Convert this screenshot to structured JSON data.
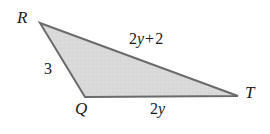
{
  "figure": {
    "type": "triangle-geometry-diagram",
    "background_color": "#ffffff",
    "fill_color": "#d7d7d7",
    "stroke_color": "#6b6b6b",
    "stroke_width": 2,
    "text_color": "#1a1a1a",
    "vertices": [
      {
        "name": "R",
        "label": "R",
        "x": 40,
        "y": 23
      },
      {
        "name": "Q",
        "label": "Q",
        "x": 85,
        "y": 97
      },
      {
        "name": "T",
        "label": "T",
        "x": 238,
        "y": 96
      }
    ],
    "sides": [
      {
        "name": "RQ",
        "from": "R",
        "to": "Q",
        "label": "3",
        "label_parts": {
          "coefficient": "3",
          "variable": "",
          "operator": "",
          "constant": ""
        }
      },
      {
        "name": "RT",
        "from": "R",
        "to": "T",
        "label": "2y + 2",
        "label_parts": {
          "coefficient": "2",
          "variable": "y",
          "operator": "+",
          "constant": "2"
        }
      },
      {
        "name": "QT",
        "from": "Q",
        "to": "T",
        "label": "2y",
        "label_parts": {
          "coefficient": "2",
          "variable": "y",
          "operator": "",
          "constant": ""
        }
      }
    ]
  }
}
